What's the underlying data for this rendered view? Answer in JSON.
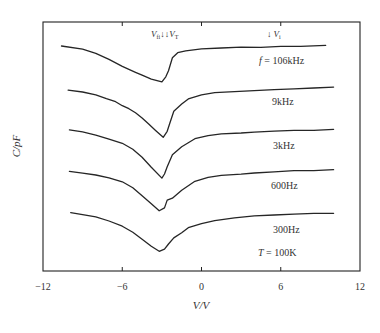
{
  "chart_data": {
    "type": "line",
    "title": "",
    "xlabel": "V/V",
    "ylabel": "C/pF",
    "xlim": [
      -12,
      12
    ],
    "ylim": [
      0,
      249
    ],
    "xticks": [
      -12,
      -6,
      0,
      6,
      12
    ],
    "xtick_labels": [
      "−12",
      "−6",
      "0",
      "6",
      "12"
    ],
    "yticks": [],
    "grid": false,
    "legend": "none (series labelled inline on right)",
    "y_units_note": "arbitrary units; curves vertically offset, no y tick labels shown",
    "series": [
      {
        "name": "f = 106kHz",
        "label": "f = 106kHz",
        "label_pos": [
          5.0,
          212
        ],
        "points": [
          [
            -10.6,
            225
          ],
          [
            -9,
            222
          ],
          [
            -8,
            218
          ],
          [
            -7,
            212
          ],
          [
            -6,
            205
          ],
          [
            -5,
            199
          ],
          [
            -4.5,
            196
          ],
          [
            -3.8,
            192
          ],
          [
            -3.0,
            189
          ],
          [
            -2.7,
            194
          ],
          [
            -2.5,
            200
          ],
          [
            -2.2,
            213
          ],
          [
            -1.8,
            218
          ],
          [
            -1.2,
            220
          ],
          [
            0,
            222
          ],
          [
            1.5,
            223
          ],
          [
            3,
            224
          ],
          [
            4.5,
            224
          ],
          [
            6,
            225
          ],
          [
            7.5,
            225
          ],
          [
            9.4,
            226
          ]
        ]
      },
      {
        "name": "9kHz",
        "label": "9kHz",
        "label_pos": [
          6.3,
          166
        ],
        "points": [
          [
            -10.1,
            181
          ],
          [
            -9,
            179
          ],
          [
            -8,
            176
          ],
          [
            -7.2,
            172
          ],
          [
            -6.5,
            169
          ],
          [
            -6,
            165
          ],
          [
            -5.5,
            162
          ],
          [
            -5,
            158
          ],
          [
            -4.5,
            153
          ],
          [
            -4,
            147
          ],
          [
            -3.5,
            141
          ],
          [
            -2.9,
            134
          ],
          [
            -2.6,
            140
          ],
          [
            -2.4,
            148
          ],
          [
            -2.1,
            160
          ],
          [
            -1.5,
            167
          ],
          [
            -1,
            172
          ],
          [
            0,
            176
          ],
          [
            1,
            178
          ],
          [
            2.5,
            179
          ],
          [
            4,
            180
          ],
          [
            5.5,
            181
          ],
          [
            7,
            182
          ],
          [
            8.5,
            183
          ],
          [
            10,
            184
          ]
        ]
      },
      {
        "name": "3kHz",
        "label": "3kHz",
        "label_pos": [
          6.4,
          124
        ],
        "points": [
          [
            -10,
            141
          ],
          [
            -9,
            139
          ],
          [
            -8,
            136
          ],
          [
            -7,
            132
          ],
          [
            -6,
            128
          ],
          [
            -5.2,
            122
          ],
          [
            -4.5,
            114
          ],
          [
            -3.8,
            104
          ],
          [
            -3.0,
            93
          ],
          [
            -2.8,
            97
          ],
          [
            -2.6,
            104
          ],
          [
            -2.2,
            116
          ],
          [
            -1.5,
            124
          ],
          [
            -0.5,
            132
          ],
          [
            0.5,
            135
          ],
          [
            1.5,
            137
          ],
          [
            3,
            138
          ],
          [
            4,
            139
          ],
          [
            5.5,
            140
          ],
          [
            7,
            141
          ],
          [
            8.5,
            141
          ],
          [
            10,
            142
          ]
        ]
      },
      {
        "name": "600Hz",
        "label": "600Hz",
        "label_pos": [
          6.0,
          84
        ],
        "points": [
          [
            -10,
            100
          ],
          [
            -9,
            98
          ],
          [
            -8,
            96
          ],
          [
            -7,
            93
          ],
          [
            -6,
            89
          ],
          [
            -5.2,
            83
          ],
          [
            -4.5,
            75
          ],
          [
            -3.8,
            67
          ],
          [
            -3.2,
            60
          ],
          [
            -2.8,
            63
          ],
          [
            -2.6,
            71
          ],
          [
            -2.2,
            73
          ],
          [
            -1.5,
            81
          ],
          [
            -0.5,
            90
          ],
          [
            0.5,
            94
          ],
          [
            1.5,
            96
          ],
          [
            3,
            97
          ],
          [
            4,
            98
          ],
          [
            5.5,
            99
          ],
          [
            7,
            100
          ],
          [
            8.5,
            100
          ],
          [
            10,
            101
          ]
        ]
      },
      {
        "name": "300Hz",
        "label": "300Hz",
        "label_pos": [
          6.0,
          41
        ],
        "points": [
          [
            -9.9,
            58
          ],
          [
            -9,
            56
          ],
          [
            -8,
            54
          ],
          [
            -7,
            50
          ],
          [
            -6,
            45
          ],
          [
            -5.2,
            39
          ],
          [
            -4.5,
            32
          ],
          [
            -3.8,
            25
          ],
          [
            -3.2,
            20
          ],
          [
            -2.8,
            22
          ],
          [
            -2.5,
            27
          ],
          [
            -2.1,
            33
          ],
          [
            -1.5,
            38
          ],
          [
            -1,
            43
          ],
          [
            0,
            47
          ],
          [
            1,
            50
          ],
          [
            2.5,
            53
          ],
          [
            4,
            55
          ],
          [
            5.5,
            56
          ],
          [
            7,
            57
          ],
          [
            8.5,
            58
          ],
          [
            10,
            58
          ]
        ]
      }
    ],
    "annotations": [
      {
        "text": "V_fi ↓↓ V_T",
        "x": -3.0,
        "y": 238,
        "note": "arrows marking V_fi and V_T near the C minimum"
      },
      {
        "text": "↓ V_i",
        "x": 5.4,
        "y": 238,
        "note": "arrow marking V_i"
      },
      {
        "text": "T = 100K",
        "x": 6.0,
        "y": 17
      }
    ]
  },
  "labels": {
    "xlabel": "V/V",
    "ylabel": "C/pF",
    "annot_left_v1": "V",
    "annot_left_v1_sub": "fi",
    "annot_left_arrows": "↓↓",
    "annot_left_v2": "V",
    "annot_left_v2_sub": "T",
    "annot_right_arrow": "↓",
    "annot_right_v": "V",
    "annot_right_v_sub": "i",
    "series_1_prefix": "f",
    "series_1_value": " = 106kHz",
    "series_2": "9kHz",
    "series_3": "3kHz",
    "series_4": "600Hz",
    "series_5": "300Hz",
    "temp_prefix": "T",
    "temp_value": " = 100K"
  }
}
